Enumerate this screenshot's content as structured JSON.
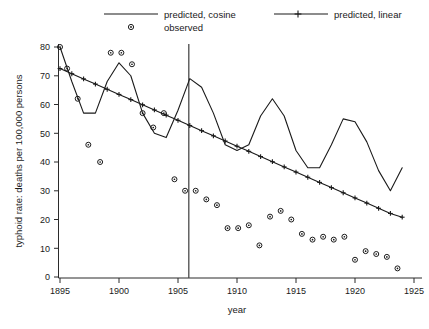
{
  "chart_data": {
    "type": "line",
    "title": "",
    "xlabel": "year",
    "ylabel": "typhoid rate: deaths per 100,000 persons",
    "xlim": [
      1894,
      1926
    ],
    "ylim": [
      0,
      84
    ],
    "xticks": [
      1895,
      1900,
      1905,
      1910,
      1915,
      1920,
      1925
    ],
    "xtick_labels": [
      "1895",
      "1900",
      "1905",
      "1910",
      "1915",
      "1920",
      "1925"
    ],
    "yticks": [
      0,
      10,
      20,
      30,
      40,
      50,
      60,
      70,
      80
    ],
    "ytick_labels": [
      "0",
      "10",
      "20",
      "30",
      "40",
      "50",
      "60",
      "70",
      "80"
    ],
    "grid": false,
    "legend_position": "above-plot",
    "annotations": [
      {
        "name": "intervention-vline",
        "type": "vertical-line",
        "x": 1906
      }
    ],
    "series": [
      {
        "name": "predicted, cosine",
        "style": "line",
        "x": [
          1895,
          1896,
          1897,
          1898,
          1899,
          1900,
          1901,
          1902,
          1903,
          1904,
          1905,
          1906,
          1907,
          1908,
          1909,
          1910,
          1911,
          1912,
          1913,
          1914,
          1915,
          1916,
          1917,
          1918,
          1919,
          1920,
          1921,
          1922,
          1923,
          1924
        ],
        "values": [
          80,
          68,
          57,
          57,
          68,
          74.5,
          70,
          57,
          50,
          48.5,
          58,
          69,
          66,
          57,
          46,
          44,
          46,
          56,
          62,
          56,
          44,
          38,
          38,
          46,
          55,
          54,
          47,
          37,
          30,
          38
        ]
      },
      {
        "name": "predicted, linear",
        "style": "line-with-markers",
        "marker": "plus",
        "x": [
          1895,
          1896,
          1897,
          1898,
          1899,
          1900,
          1901,
          1902,
          1903,
          1904,
          1905,
          1906,
          1907,
          1908,
          1909,
          1910,
          1911,
          1912,
          1913,
          1914,
          1915,
          1916,
          1917,
          1918,
          1919,
          1920,
          1921,
          1922,
          1923,
          1924
        ],
        "values": [
          72.5,
          70.7,
          68.9,
          67.1,
          65.3,
          63.5,
          61.7,
          59.9,
          58.1,
          56.3,
          54.5,
          52.7,
          50.9,
          49.1,
          47.3,
          45.5,
          43.7,
          41.9,
          40.1,
          38.3,
          36.5,
          34.7,
          32.9,
          31.1,
          29.3,
          27.5,
          25.7,
          23.9,
          22.1,
          20.8
        ]
      },
      {
        "name": "observed",
        "style": "points",
        "marker": "circle-open",
        "x": [
          1895,
          1895.6,
          1896.5,
          1897.4,
          1898.4,
          1899.3,
          1900.2,
          1901.1,
          1902,
          1902.9,
          1903.8,
          1904.7,
          1905.6,
          1906.5,
          1907.4,
          1908.3,
          1909.2,
          1910.1,
          1911,
          1911.9,
          1912.8,
          1913.7,
          1914.6,
          1915.5,
          1916.4,
          1917.3,
          1918.2,
          1919.1,
          1920,
          1920.9,
          1921.8,
          1922.7,
          1923.6
        ],
        "values": [
          80,
          72.5,
          62,
          46,
          40,
          78,
          78,
          74,
          57,
          52,
          57,
          34,
          30,
          30,
          27,
          25,
          17,
          17,
          18,
          11,
          21,
          23,
          20,
          15,
          13,
          14,
          13,
          14,
          6,
          9,
          8,
          7,
          3
        ]
      }
    ]
  },
  "legend": {
    "entries": [
      {
        "label": "predicted, cosine",
        "marker": "line"
      },
      {
        "label": "observed",
        "marker": "circle-open"
      },
      {
        "label": "predicted, linear",
        "marker": "line-plus"
      }
    ]
  }
}
